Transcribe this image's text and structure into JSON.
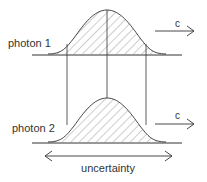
{
  "diagram": {
    "photon1": {
      "label": "photon 1",
      "velocity_label": "c"
    },
    "photon2": {
      "label": "photon 2",
      "velocity_label": "c"
    },
    "uncertainty_label": "uncertainty",
    "colors": {
      "stroke": "#333333",
      "hatch": "#555555",
      "text": "#333333"
    }
  }
}
